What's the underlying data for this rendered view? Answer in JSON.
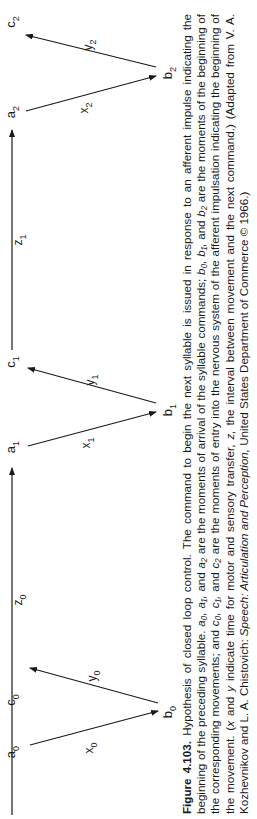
{
  "figure": {
    "nodes": [
      {
        "id": "a0",
        "letter": "a",
        "sub": "0",
        "x": 15,
        "y": 752
      },
      {
        "id": "b0",
        "letter": "b",
        "sub": "0",
        "x": 172,
        "y": 712
      },
      {
        "id": "c0",
        "letter": "c",
        "sub": "0",
        "x": 15,
        "y": 700
      },
      {
        "id": "a1",
        "letter": "a",
        "sub": "1",
        "x": 15,
        "y": 447
      },
      {
        "id": "b1",
        "letter": "b",
        "sub": "1",
        "x": 172,
        "y": 410
      },
      {
        "id": "c1",
        "letter": "c",
        "sub": "1",
        "x": 15,
        "y": 362
      },
      {
        "id": "a2",
        "letter": "a",
        "sub": "2",
        "x": 15,
        "y": 112
      },
      {
        "id": "b2",
        "letter": "b",
        "sub": "2",
        "x": 172,
        "y": 73
      },
      {
        "id": "c2",
        "letter": "c",
        "sub": "2",
        "x": 15,
        "y": 22
      }
    ],
    "arrows": [
      {
        "id": "x0",
        "from": [
          30,
          745
        ],
        "to": [
          158,
          711
        ],
        "label_letter": "x",
        "label_sub": "0",
        "lx": 93,
        "ly": 748
      },
      {
        "id": "y0",
        "from": [
          158,
          703
        ],
        "to": [
          30,
          668
        ],
        "label_letter": "y",
        "label_sub": "0",
        "lx": 96,
        "ly": 676
      },
      {
        "id": "z0",
        "from": [
          12,
          815
        ],
        "to": [
          12,
          468
        ],
        "label_letter": "z",
        "label_sub": "0",
        "lx": 22,
        "ly": 600
      },
      {
        "id": "x1",
        "from": [
          28,
          446
        ],
        "to": [
          156,
          412
        ],
        "label_letter": "x",
        "label_sub": "1",
        "lx": 90,
        "ly": 443
      },
      {
        "id": "y1",
        "from": [
          156,
          403
        ],
        "to": [
          28,
          368
        ],
        "label_letter": "y",
        "label_sub": "1",
        "lx": 94,
        "ly": 380
      },
      {
        "id": "z1",
        "from": [
          12,
          350
        ],
        "to": [
          12,
          130
        ],
        "label_letter": "z",
        "label_sub": "1",
        "lx": 22,
        "ly": 240
      },
      {
        "id": "x2",
        "from": [
          26,
          111
        ],
        "to": [
          156,
          76
        ],
        "label_letter": "x",
        "label_sub": "2",
        "lx": 88,
        "ly": 108
      },
      {
        "id": "y2",
        "from": [
          156,
          67
        ],
        "to": [
          26,
          35
        ],
        "label_letter": "y",
        "label_sub": "2",
        "lx": 92,
        "ly": 45
      }
    ],
    "stroke_color": "#1a1a1a"
  },
  "caption": {
    "figure_label": "Figure 4.103.",
    "text_1": " Hypothesis of closed loop control. The command to begin the next syllable is issued in response to an afferent impulse indicating the beginning of the preceding syllable. ",
    "a_vars": "a₀, a₁,",
    "text_2": " and ",
    "a2_var": "a₂",
    "text_3": " are the moments of arrival of the syllable commands; ",
    "b_vars": "b₀, b₁,",
    "text_4": " and ",
    "b2_var": "b₂",
    "text_5": " are the moments of the beginning of the corresponding movements; and ",
    "c_vars": "c₀, c₁,",
    "text_6": " and ",
    "c2_var": "c₂",
    "text_7": " are the moments of entry into the nervous system of the afferent impulsation indicating the beginning of the movement. (",
    "x_var": "x",
    "text_8": " and ",
    "y_var": "y",
    "text_9": " indicate time for motor and sensory transfer, ",
    "z_var": "z,",
    "text_10": " the interval between movement and the next command.) (Adapted from V. A. Kozhevnikov and L. A. Chistovich: ",
    "source_title": "Speech: Articulation and Perception,",
    "text_11": " United States Department of Commerce © 1966.)"
  }
}
